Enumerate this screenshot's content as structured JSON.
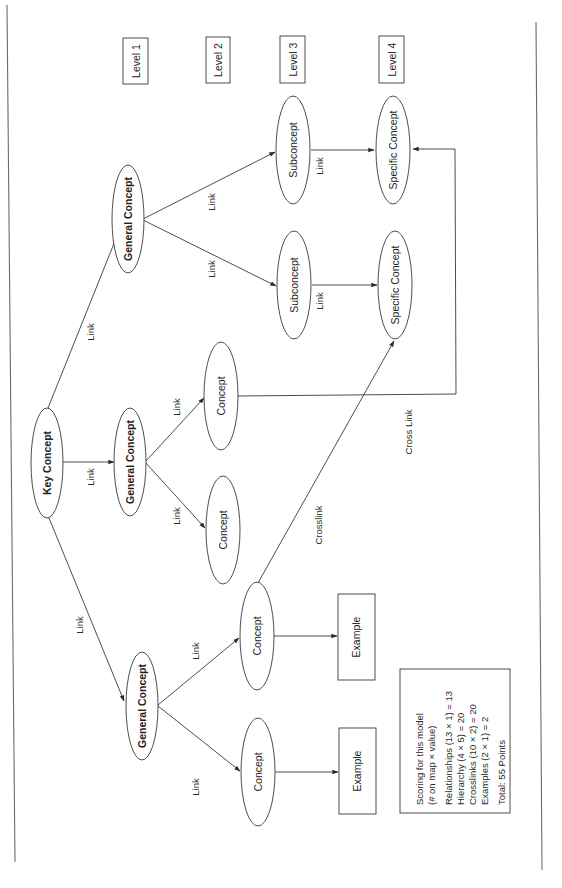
{
  "diagram": {
    "type": "concept-map",
    "orientation": "rotated-90-ccw",
    "colors": {
      "stroke": "#3a3a3a",
      "text": "#1e1e1e",
      "background": "#ffffff"
    },
    "levels": [
      {
        "label": "Level 1"
      },
      {
        "label": "Level 2"
      },
      {
        "label": "Level 3"
      },
      {
        "label": "Level 4"
      }
    ],
    "nodes": {
      "key": {
        "label": "Key Concept",
        "level": 1
      },
      "gen_top": {
        "label": "General Concept",
        "level": 2
      },
      "gen_mid": {
        "label": "General Concept",
        "level": 2
      },
      "gen_bot": {
        "label": "General Concept",
        "level": 2
      },
      "sub_a": {
        "label": "Subconcept",
        "level": 3
      },
      "sub_b": {
        "label": "Subconcept",
        "level": 3
      },
      "spec_a": {
        "label": "Specific Concept",
        "level": 4
      },
      "spec_b": {
        "label": "Specific Concept",
        "level": 4
      },
      "con_mid_a": {
        "label": "Concept",
        "level": 3
      },
      "con_mid_b": {
        "label": "Concept",
        "level": 3
      },
      "con_bot_a": {
        "label": "Concept",
        "level": 3
      },
      "con_bot_b": {
        "label": "Concept",
        "level": 3
      },
      "ex_a": {
        "label": "Example"
      },
      "ex_b": {
        "label": "Example"
      }
    },
    "edges": [
      {
        "from": "key",
        "to": "gen_top",
        "label": "Link"
      },
      {
        "from": "key",
        "to": "gen_mid",
        "label": "Link"
      },
      {
        "from": "key",
        "to": "gen_bot",
        "label": "Link"
      },
      {
        "from": "gen_top",
        "to": "sub_a",
        "label": "Link"
      },
      {
        "from": "gen_top",
        "to": "sub_b",
        "label": "Link"
      },
      {
        "from": "sub_a",
        "to": "spec_a",
        "label": "Link"
      },
      {
        "from": "sub_b",
        "to": "spec_b",
        "label": "Link"
      },
      {
        "from": "gen_mid",
        "to": "con_mid_a",
        "label": "Link"
      },
      {
        "from": "gen_mid",
        "to": "con_mid_b",
        "label": "Link"
      },
      {
        "from": "gen_bot",
        "to": "con_bot_a",
        "label": "Link"
      },
      {
        "from": "gen_bot",
        "to": "con_bot_b",
        "label": "Link"
      },
      {
        "from": "con_bot_a",
        "to": "ex_a",
        "label": ""
      },
      {
        "from": "con_bot_b",
        "to": "ex_b",
        "label": ""
      },
      {
        "from": "con_mid_a",
        "to": "spec_a",
        "label": "Cross Link"
      },
      {
        "from": "con_bot_a",
        "to": "spec_b",
        "label": "Crosslink"
      }
    ],
    "edge_labels": {
      "link": "Link",
      "cross_link": "Cross Link",
      "crosslink": "Crosslink"
    },
    "scoring": {
      "title_line1": "Scoring for this model",
      "title_line2": "(# on map × value)",
      "lines": [
        "Relationships (13 × 1) = 13",
        "Hierarchy (4 × 5) = 20",
        "Crosslinks (10 × 2) = 20",
        "Examples (2 × 1) = 2"
      ],
      "total": "Total: 55 Points",
      "items": [
        {
          "name": "Relationships",
          "count": 13,
          "value": 1,
          "score": 13
        },
        {
          "name": "Hierarchy",
          "count": 4,
          "value": 5,
          "score": 20
        },
        {
          "name": "Crosslinks",
          "count": 10,
          "value": 2,
          "score": 20
        },
        {
          "name": "Examples",
          "count": 2,
          "value": 1,
          "score": 2
        }
      ],
      "total_points": 55
    }
  }
}
